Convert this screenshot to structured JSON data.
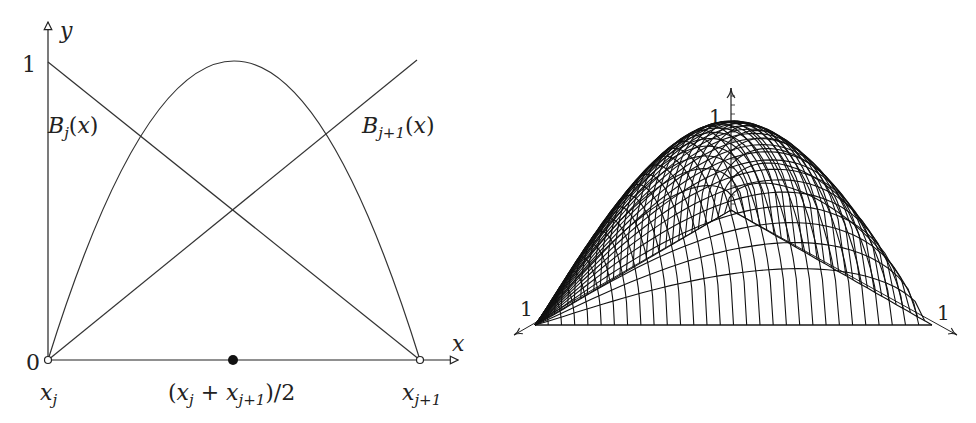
{
  "chart_data": [
    {
      "type": "line",
      "title": "",
      "xlabel": "x",
      "ylabel": "y",
      "xlim": [
        0,
        1
      ],
      "ylim": [
        0,
        1
      ],
      "x_tick_labels": [
        "x_j",
        "(x_j + x_{j+1})/2",
        "x_{j+1}"
      ],
      "y_tick_labels": [
        "0",
        "1"
      ],
      "series": [
        {
          "name": "B_j(x)",
          "x": [
            0,
            1
          ],
          "y": [
            1,
            0
          ]
        },
        {
          "name": "B_{j+1}(x)",
          "x": [
            0,
            1
          ],
          "y": [
            0,
            1
          ]
        },
        {
          "name": "bubble 4·B_j·B_{j+1}",
          "x": [
            0,
            0.25,
            0.5,
            0.75,
            1
          ],
          "y": [
            0,
            0.75,
            1,
            0.75,
            0
          ]
        }
      ],
      "markers": [
        {
          "x": 0,
          "y": 0,
          "style": "open-circle"
        },
        {
          "x": 1,
          "y": 0,
          "style": "open-circle"
        },
        {
          "x": 0.5,
          "y": 0,
          "style": "filled-dot"
        }
      ],
      "grid": false,
      "legend": "none (inline labels)"
    },
    {
      "type": "surface",
      "title": "",
      "description": "3D wireframe surface of a bubble function over a triangle",
      "axis_labels": [
        "1",
        "1",
        "1"
      ],
      "grid": false
    }
  ],
  "left": {
    "y_axis_label": "y",
    "x_axis_label": "x",
    "y_one": "1",
    "y_zero": "0",
    "label_bj_main": "B",
    "label_bj_sub": "j",
    "label_bj_arg": "(x)",
    "label_bj1_main": "B",
    "label_bj1_sub": "j+1",
    "label_bj1_arg": "(x)",
    "xj_main": "x",
    "xj_sub": "j",
    "xj1_main": "x",
    "xj1_sub": "j+1",
    "mid_open": "(x",
    "mid_sub1": "j",
    "mid_plus": " + x",
    "mid_sub2": "j+1",
    "mid_close": ")/2"
  },
  "right": {
    "z_label": "1",
    "left_label": "1",
    "right_label": "1",
    "mesh": {
      "A": [
        535,
        325
      ],
      "B": [
        932,
        325
      ],
      "C": [
        731,
        210
      ],
      "height": 168,
      "radial_count": 28,
      "arch_count": 30
    }
  },
  "colors": {
    "ink": "#222222",
    "curve": "#333333"
  }
}
